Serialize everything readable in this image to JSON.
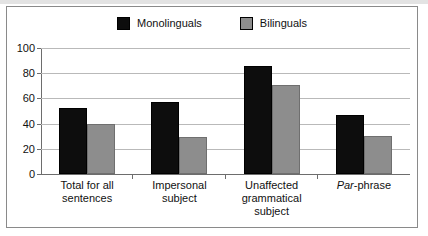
{
  "chart_data": {
    "type": "bar",
    "title": "",
    "subtitle": "",
    "xlabel": "",
    "ylabel": "",
    "ylim": [
      0,
      100
    ],
    "yticks": [
      0,
      20,
      40,
      60,
      80,
      100
    ],
    "grid": true,
    "legend_position": "top-center",
    "categories": [
      "Total for all sentences",
      "Impersonal subject",
      "Unaffected grammatical subject",
      "Par-phrase"
    ],
    "category_lines": [
      [
        "Total for all",
        "sentences"
      ],
      [
        "Impersonal",
        "subject"
      ],
      [
        "Unaffected",
        "grammatical",
        "subject"
      ],
      [
        "Par-phrase"
      ]
    ],
    "series": [
      {
        "name": "Monolinguals",
        "color": "#0d0d0d",
        "values": [
          52,
          57,
          86,
          47
        ]
      },
      {
        "name": "Bilinguals",
        "color": "#8d8d8d",
        "values": [
          40,
          29,
          71,
          30
        ]
      }
    ]
  },
  "legend": {
    "entries": [
      {
        "label": "Monolinguals"
      },
      {
        "label": "Bilinguals"
      }
    ]
  },
  "axes": {
    "y_tick_labels": [
      "100",
      "80",
      "60",
      "40",
      "20",
      "0"
    ]
  },
  "category_labels": {
    "c0_l0": "Total for all",
    "c0_l1": "sentences",
    "c1_l0": "Impersonal",
    "c1_l1": "subject",
    "c2_l0": "Unaffected",
    "c2_l1": "grammatical",
    "c2_l2": "subject",
    "c3_italic": "Par",
    "c3_rest": "-phrase"
  },
  "colors": {
    "monolinguals": "#0d0d0d",
    "bilinguals": "#8d8d8d",
    "gridline": "#b9b9b9",
    "axis": "#6d6d6d",
    "frame": "#8a8a8a",
    "background": "#ffffff"
  }
}
